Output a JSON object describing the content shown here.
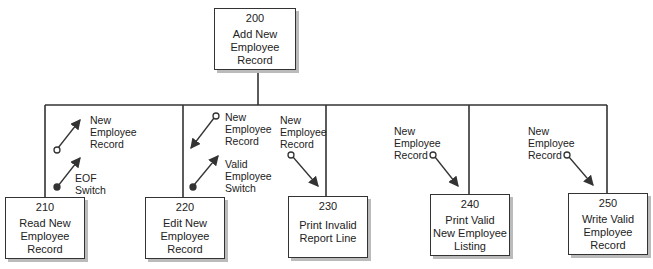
{
  "root": {
    "number": "200",
    "label": "Add New\nEmployee\nRecord"
  },
  "modules": [
    {
      "number": "210",
      "label": "Read New\nEmployee\nRecord"
    },
    {
      "number": "220",
      "label": "Edit New\nEmployee\nRecord"
    },
    {
      "number": "230",
      "label": "Print Invalid\nReport Line"
    },
    {
      "number": "240",
      "label": "Print Valid\nNew Employee\nListing"
    },
    {
      "number": "250",
      "label": "Write Valid\nEmployee\nRecord"
    }
  ],
  "couples": [
    {
      "module": "210",
      "type": "data",
      "direction": "up",
      "label": "New\nEmployee\nRecord"
    },
    {
      "module": "210",
      "type": "control",
      "direction": "up",
      "label": "EOF\nSwitch"
    },
    {
      "module": "220",
      "type": "data",
      "direction": "down",
      "label": "New\nEmployee\nRecord"
    },
    {
      "module": "220",
      "type": "control",
      "direction": "up",
      "label": "Valid\nEmployee\nSwitch"
    },
    {
      "module": "230",
      "type": "data",
      "direction": "down",
      "label": "New\nEmployee\nRecord"
    },
    {
      "module": "240",
      "type": "data",
      "direction": "down",
      "label": "New\nEmployee\nRecord"
    },
    {
      "module": "250",
      "type": "data",
      "direction": "down",
      "label": "New\nEmployee\nRecord"
    }
  ]
}
